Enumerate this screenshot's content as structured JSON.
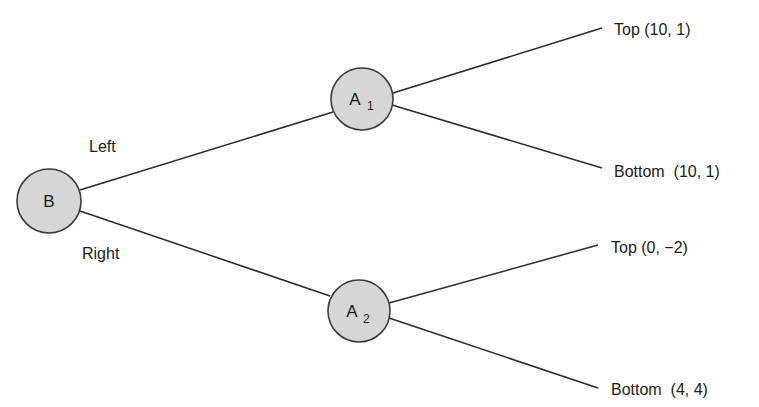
{
  "diagram": {
    "type": "game-tree",
    "nodes": {
      "root": {
        "label": "B",
        "subscript": ""
      },
      "a1": {
        "label": "A",
        "subscript": "1"
      },
      "a2": {
        "label": "A",
        "subscript": "2"
      }
    },
    "edges": {
      "left": {
        "label": "Left",
        "from": "B",
        "to": "A1"
      },
      "right": {
        "label": "Right",
        "from": "B",
        "to": "A2"
      },
      "a1_top": {
        "from": "A1",
        "to": "outcome_1"
      },
      "a1_bottom": {
        "from": "A1",
        "to": "outcome_2"
      },
      "a2_top": {
        "from": "A2",
        "to": "outcome_3"
      },
      "a2_bottom": {
        "from": "A2",
        "to": "outcome_4"
      }
    },
    "outcomes": [
      {
        "action": "Top",
        "payoff": "(10, 1)",
        "text": "Top (10, 1)"
      },
      {
        "action": "Bottom",
        "payoff": "(10, 1)",
        "text": "Bottom  (10, 1)"
      },
      {
        "action": "Top",
        "payoff": "(0, −2)",
        "text": "Top (0, −2)"
      },
      {
        "action": "Bottom",
        "payoff": "(4, 4)",
        "text": "Bottom  (4, 4)"
      }
    ]
  }
}
